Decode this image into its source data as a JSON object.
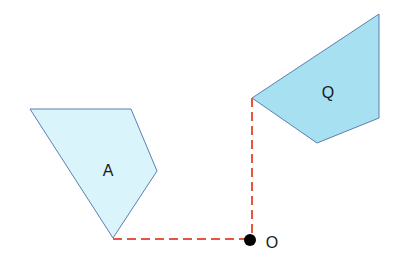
{
  "diagram": {
    "shapes": [
      {
        "id": "A",
        "label": "A",
        "points": "30,109 131,109 157,171 113,238",
        "fill": "#d9f4fb",
        "stroke": "#5b7fb0",
        "label_pos": [
          108,
          176
        ]
      },
      {
        "id": "Q",
        "label": "Q",
        "points": "252,98 379,14 379,118 317,143",
        "fill": "#a6e0f1",
        "stroke": "#5b7fb0",
        "label_pos": [
          328,
          98
        ]
      }
    ],
    "origin": {
      "label": "O",
      "x": 250,
      "y": 240,
      "label_pos": [
        272,
        248
      ]
    },
    "dashed_lines": [
      {
        "x1": 113,
        "y1": 239,
        "x2": 250,
        "y2": 239
      },
      {
        "x1": 252,
        "y1": 98,
        "x2": 252,
        "y2": 239
      }
    ],
    "colors": {
      "dashed": "#e8553f",
      "point": "#000000"
    }
  }
}
